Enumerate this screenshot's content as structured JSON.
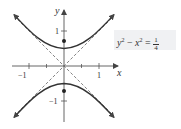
{
  "equation": {
    "lhs_term1": "y",
    "lhs_exp1": "2",
    "minus": " − ",
    "lhs_term2": "x",
    "lhs_exp2": "2",
    "equals": " = ",
    "numerator": "1",
    "denominator": "4",
    "full_text": "y² − x² = 1/4"
  },
  "axes": {
    "x_label": "x",
    "y_label": "y",
    "x_ticks": [
      "−1",
      "1"
    ],
    "y_ticks": [
      "1",
      "−1"
    ]
  },
  "diagram": {
    "type": "hyperbola",
    "equation": "y^2 - x^2 = 1/4",
    "vertices": [
      [
        0,
        0.5
      ],
      [
        0,
        -0.5
      ]
    ],
    "foci": [
      [
        0,
        0.707
      ],
      [
        0,
        -0.707
      ]
    ],
    "asymptotes": [
      "y = x",
      "y = -x"
    ],
    "x_range": [
      -1.4,
      1.4
    ],
    "y_range": [
      -1.4,
      1.4
    ],
    "colors": {
      "curve": "#333333",
      "asymptote": "#666666",
      "axis": "#555555",
      "box": "#f0f1f3"
    }
  }
}
